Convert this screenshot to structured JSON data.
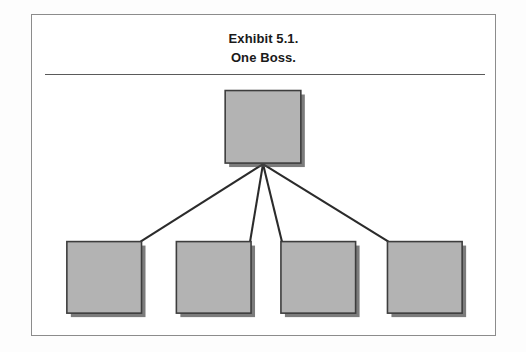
{
  "exhibit": {
    "title_line_1": "Exhibit 5.1.",
    "title_line_2": "One Boss.",
    "has_title_rule": true,
    "frame_border_color": "#8c8c8c",
    "background_color": "#ffffff"
  },
  "chart_data": {
    "type": "diagram",
    "subtype": "organizational-hierarchy-tree",
    "title": "Exhibit 5.1. One Boss.",
    "orientation": "top-down",
    "levels": 2,
    "node_fill_color": "#b3b3b3",
    "node_border_color": "#3d3d3d",
    "connector_color": "#2b2b2b",
    "shadow_color": "#4a4a4a",
    "nodes": [
      {
        "id": "boss",
        "label": "",
        "level": 0,
        "x": 225,
        "y": 90,
        "width": 76,
        "height": 73
      },
      {
        "id": "subordinate-1",
        "label": "",
        "level": 1,
        "x": 66,
        "y": 242,
        "width": 75,
        "height": 72
      },
      {
        "id": "subordinate-2",
        "label": "",
        "level": 1,
        "x": 176,
        "y": 242,
        "width": 75,
        "height": 72
      },
      {
        "id": "subordinate-3",
        "label": "",
        "level": 1,
        "x": 281,
        "y": 242,
        "width": 75,
        "height": 72
      },
      {
        "id": "subordinate-4",
        "label": "",
        "level": 1,
        "x": 388,
        "y": 242,
        "width": 75,
        "height": 72
      }
    ],
    "edges": [
      {
        "from": "boss",
        "to": "subordinate-1"
      },
      {
        "from": "boss",
        "to": "subordinate-2"
      },
      {
        "from": "boss",
        "to": "subordinate-3"
      },
      {
        "from": "boss",
        "to": "subordinate-4"
      }
    ],
    "convergence_point": {
      "x": 263,
      "y": 164
    }
  }
}
